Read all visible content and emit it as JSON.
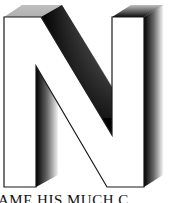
{
  "illustration": {
    "letter": "N",
    "style": "3D block letter with dithered drop shadow",
    "fill_color": "#ffffff",
    "outline_color": "#1a1a1a",
    "shadow_color": "#000000"
  },
  "caption": {
    "text": "AME HIS MUCH C"
  }
}
